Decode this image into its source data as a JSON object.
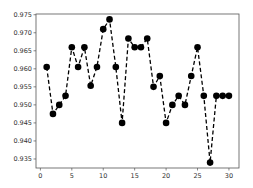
{
  "chart_data": {
    "type": "line",
    "title": "",
    "xlabel": "",
    "ylabel": "",
    "x": [
      1,
      2,
      3,
      4,
      5,
      6,
      7,
      8,
      9,
      10,
      11,
      12,
      13,
      14,
      15,
      16,
      17,
      18,
      19,
      20,
      21,
      22,
      23,
      24,
      25,
      26,
      27,
      28,
      29,
      30
    ],
    "series": [
      {
        "name": "series",
        "style": "dashed-black-with-circle-markers",
        "color": "#000000",
        "values": [
          0.9605,
          0.9475,
          0.95,
          0.9525,
          0.966,
          0.9605,
          0.966,
          0.9553,
          0.9605,
          0.971,
          0.9737,
          0.9605,
          0.945,
          0.9684,
          0.966,
          0.966,
          0.9684,
          0.955,
          0.958,
          0.945,
          0.95,
          0.9525,
          0.95,
          0.958,
          0.966,
          0.9525,
          0.934,
          0.9525,
          0.9525,
          0.9525
        ]
      }
    ],
    "xlim": [
      -0.7,
      31.6
    ],
    "ylim": [
      0.9325,
      0.9752
    ],
    "xticks": [
      0,
      5,
      10,
      15,
      20,
      25,
      30
    ],
    "yticks": [
      0.935,
      0.94,
      0.945,
      0.95,
      0.955,
      0.96,
      0.965,
      0.97,
      0.975
    ],
    "ytick_labels": [
      "0.935",
      "0.940",
      "0.945",
      "0.950",
      "0.955",
      "0.960",
      "0.965",
      "0.970",
      "0.975"
    ],
    "xtick_labels": [
      "0",
      "5",
      "10",
      "15",
      "20",
      "25",
      "30"
    ],
    "grid": false,
    "legend": null
  }
}
